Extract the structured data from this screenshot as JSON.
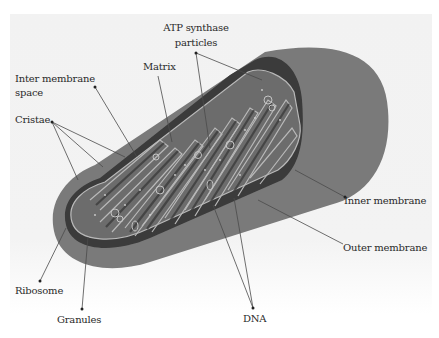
{
  "diagram": {
    "colors": {
      "background": "#f3f3f3",
      "outer_body": "#7a7a7a",
      "inner_cavity": "#363636",
      "cristae_fill": "#6c6c6c",
      "cristae_outline": "#b9b9b9",
      "leader_line": "#444444",
      "label_text": "#2a2a2a"
    },
    "labels": {
      "atp_line1": "ATP synthase",
      "atp_line2": "particles",
      "matrix": "Matrix",
      "inter_membrane_line1": "Inter membrane",
      "inter_membrane_line2": "space",
      "cristae": "Cristae",
      "inner_membrane": "Inner membrane",
      "outer_membrane": "Outer membrane",
      "ribosome": "Ribosome",
      "granules": "Granules",
      "dna": "DNA"
    }
  }
}
